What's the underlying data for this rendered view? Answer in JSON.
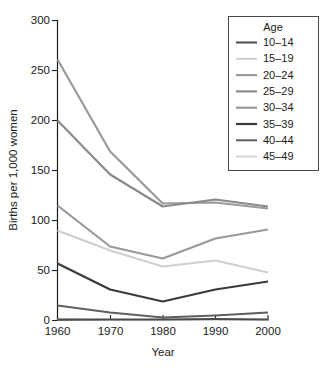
{
  "chart_data": {
    "type": "line",
    "title": "",
    "xlabel": "Year",
    "ylabel": "Births per 1,000 women",
    "x": [
      1960,
      1970,
      1980,
      1990,
      2000
    ],
    "xticklabels": [
      "1960",
      "1970",
      "1980",
      "1990",
      "2000"
    ],
    "yticklabels": [
      "0",
      "50",
      "100",
      "150",
      "200",
      "250",
      "300"
    ],
    "yticks": [
      0,
      50,
      100,
      150,
      200,
      250,
      300
    ],
    "ylim": [
      0,
      300
    ],
    "xlim": [
      1960,
      2000
    ],
    "grid": false,
    "legend_position": "top-right",
    "legend_title": "Age",
    "series": [
      {
        "name": "10-14",
        "color": "#4a4a4a",
        "width": 2.0,
        "values": [
          1,
          1,
          1,
          1.5,
          1
        ]
      },
      {
        "name": "15-19",
        "color": "#cfcfcf",
        "width": 2.0,
        "values": [
          90,
          70,
          54,
          60,
          48
        ]
      },
      {
        "name": "20-24",
        "color": "#9a9a9a",
        "width": 2.2,
        "values": [
          261,
          169,
          117,
          118,
          112
        ]
      },
      {
        "name": "25-29",
        "color": "#8a8a8a",
        "width": 2.2,
        "values": [
          200,
          146,
          114,
          121,
          114
        ]
      },
      {
        "name": "30-34",
        "color": "#999999",
        "width": 2.2,
        "values": [
          115,
          74,
          62,
          82,
          91
        ]
      },
      {
        "name": "35-39",
        "color": "#3a3a3a",
        "width": 2.2,
        "values": [
          57,
          31,
          19,
          31,
          39
        ]
      },
      {
        "name": "40-44",
        "color": "#5f5f5f",
        "width": 2.0,
        "values": [
          15,
          8,
          3,
          5,
          8
        ]
      },
      {
        "name": "45-49",
        "color": "#d8d8d8",
        "width": 2.0,
        "values": [
          1,
          0.5,
          0.5,
          0.5,
          0.5
        ]
      }
    ]
  },
  "legend": {
    "title": "Age",
    "entries": [
      "10–14",
      "15–19",
      "20–24",
      "25–29",
      "30–34",
      "35–39",
      "40–44",
      "45–49"
    ]
  },
  "axes": {
    "y_title": "Births per 1,000 women",
    "x_title": "Year",
    "y_labels": [
      "300",
      "250",
      "200",
      "150",
      "100",
      "50",
      "0"
    ],
    "x_labels": [
      "1960",
      "1970",
      "1980",
      "1990",
      "2000"
    ]
  }
}
